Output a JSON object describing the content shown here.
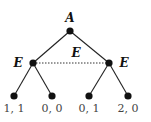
{
  "diagram": {
    "type": "game-tree",
    "root": {
      "label": "A",
      "x": 70,
      "y": 31
    },
    "decision_nodes": [
      {
        "label": "E",
        "x": 33,
        "y": 63,
        "label_x": 18,
        "label_y": 67
      },
      {
        "label": "E",
        "x": 109,
        "y": 63,
        "label_x": 124,
        "label_y": 67
      }
    ],
    "information_set": {
      "label": "E",
      "style": "dotted",
      "label_x": 76,
      "label_y": 57
    },
    "leaves": [
      {
        "x": 14,
        "y": 96,
        "payoff": "1, 1"
      },
      {
        "x": 52,
        "y": 96,
        "payoff": "0, 0"
      },
      {
        "x": 89,
        "y": 96,
        "payoff": "0, 1"
      },
      {
        "x": 128,
        "y": 96,
        "payoff": "2, 0"
      }
    ],
    "colors": {
      "line": "#222222",
      "node": "#111111",
      "payoff": "#444444"
    }
  }
}
